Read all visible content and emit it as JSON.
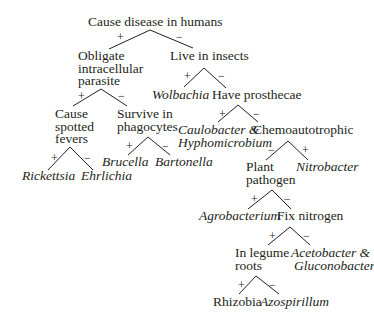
{
  "diagram": {
    "type": "dichotomous-key",
    "branch_labels": {
      "yes": "+",
      "no": "−"
    },
    "nodes": {
      "root": {
        "lines": [
          "Cause disease in humans"
        ]
      },
      "obligate": {
        "lines": [
          "Obligate",
          "intracellular",
          "parasite"
        ]
      },
      "insects": {
        "lines": [
          "Live in insects"
        ]
      },
      "spotted": {
        "lines": [
          "Cause",
          "spotted",
          "fevers"
        ]
      },
      "phagocytes": {
        "lines": [
          "Survive in",
          "phagocytes"
        ]
      },
      "wolbachia": {
        "lines": [
          "Wolbachia"
        ]
      },
      "prosthecae": {
        "lines": [
          "Have prosthecae"
        ]
      },
      "rickettsia": {
        "lines": [
          "Rickettsia"
        ]
      },
      "ehrlichia": {
        "lines": [
          "Ehrlichia"
        ]
      },
      "brucella": {
        "lines": [
          "Brucella"
        ]
      },
      "bartonella": {
        "lines": [
          "Bartonella"
        ]
      },
      "caulobacter": {
        "lines": [
          "Caulobacter &",
          "Hyphomicrobium"
        ]
      },
      "chemo": {
        "lines": [
          "Chemoautotrophic"
        ]
      },
      "plant": {
        "lines": [
          "Plant",
          "pathogen"
        ]
      },
      "nitrobacter": {
        "lines": [
          "Nitrobacter"
        ]
      },
      "agrobacterium": {
        "lines": [
          "Agrobacterium"
        ]
      },
      "fixn": {
        "lines": [
          "Fix nitrogen"
        ]
      },
      "legume": {
        "lines": [
          "In legume",
          "roots"
        ]
      },
      "aceto": {
        "lines": [
          "Acetobacter &",
          "Gluconobacter"
        ]
      },
      "rhizobia": {
        "lines": [
          "Rhizobia"
        ]
      },
      "azospirillum": {
        "lines": [
          "Azospirillum"
        ]
      }
    },
    "signs": {
      "root_left": "+",
      "root_right": "−",
      "insects_left": "+",
      "insects_right": "−",
      "obligate_left": "+",
      "obligate_right": "−",
      "spotted_left": "+",
      "spotted_right": "−",
      "phago_left": "+",
      "phago_right": "−",
      "prosth_left": "+",
      "prosth_right": "−",
      "chemo_left": "−",
      "chemo_right": "+",
      "plant_left": "+",
      "plant_right": "−",
      "fixn_left": "+",
      "fixn_right": "−",
      "legume_left": "+",
      "legume_right": "−"
    },
    "edges": [
      {
        "from": "Cause disease in humans",
        "to": "Obligate intracellular parasite",
        "label": "+"
      },
      {
        "from": "Cause disease in humans",
        "to": "Live in insects",
        "label": "−"
      },
      {
        "from": "Obligate intracellular parasite",
        "to": "Cause spotted fevers",
        "label": "+"
      },
      {
        "from": "Obligate intracellular parasite",
        "to": "Survive in phagocytes",
        "label": "−"
      },
      {
        "from": "Cause spotted fevers",
        "to": "Rickettsia",
        "label": "+"
      },
      {
        "from": "Cause spotted fevers",
        "to": "Ehrlichia",
        "label": "−"
      },
      {
        "from": "Survive in phagocytes",
        "to": "Brucella",
        "label": "+"
      },
      {
        "from": "Survive in phagocytes",
        "to": "Bartonella",
        "label": "−"
      },
      {
        "from": "Live in insects",
        "to": "Wolbachia",
        "label": "+"
      },
      {
        "from": "Live in insects",
        "to": "Have prosthecae",
        "label": "−"
      },
      {
        "from": "Have prosthecae",
        "to": "Caulobacter & Hyphomicrobium",
        "label": "+"
      },
      {
        "from": "Have prosthecae",
        "to": "Chemoautotrophic",
        "label": "−"
      },
      {
        "from": "Chemoautotrophic",
        "to": "Plant pathogen",
        "label": "−"
      },
      {
        "from": "Chemoautotrophic",
        "to": "Nitrobacter",
        "label": "+"
      },
      {
        "from": "Plant pathogen",
        "to": "Agrobacterium",
        "label": "+"
      },
      {
        "from": "Plant pathogen",
        "to": "Fix nitrogen",
        "label": "−"
      },
      {
        "from": "Fix nitrogen",
        "to": "In legume roots",
        "label": "+"
      },
      {
        "from": "Fix nitrogen",
        "to": "Acetobacter & Gluconobacter",
        "label": "−"
      },
      {
        "from": "In legume roots",
        "to": "Rhizobia",
        "label": "+"
      },
      {
        "from": "In legume roots",
        "to": "Azospirillum",
        "label": "−"
      }
    ]
  }
}
